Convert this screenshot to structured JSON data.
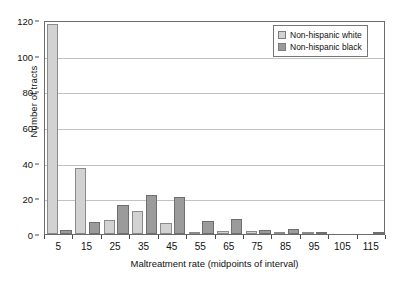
{
  "chart_data": {
    "type": "bar",
    "title": "",
    "subtitle": "",
    "xlabel": "Maltreatment rate (midpoints of interval)",
    "ylabel": "Number of tracts",
    "categories": [
      5,
      15,
      25,
      35,
      45,
      55,
      65,
      75,
      85,
      95,
      105,
      115
    ],
    "xtick_labels": [
      "5",
      "15",
      "25",
      "35",
      "45",
      "55",
      "65",
      "75",
      "85",
      "95",
      "105",
      "115"
    ],
    "ytick_labels": [
      "0",
      "20",
      "40",
      "60",
      "80",
      "100",
      "120"
    ],
    "ytick_values": [
      0,
      20,
      40,
      60,
      80,
      100,
      120
    ],
    "ylim": [
      0,
      120
    ],
    "xlim": [
      0,
      120
    ],
    "grid": "horizontal",
    "legend_position": "top-right",
    "series": [
      {
        "name": "Non-hispanic white",
        "color": "#d2d2d2",
        "values": [
          118,
          37,
          8,
          13,
          6,
          1,
          1.5,
          1.5,
          0.5,
          0.5,
          0,
          0
        ]
      },
      {
        "name": "Non-hispanic black",
        "color": "#9b9b9b",
        "values": [
          2,
          7,
          16,
          22,
          21,
          7.5,
          8.5,
          2.5,
          3,
          0.5,
          0,
          0.7
        ]
      }
    ]
  },
  "legend": {
    "items": [
      {
        "label": "Non-hispanic white",
        "swatch": "white"
      },
      {
        "label": "Non-hispanic black",
        "swatch": "black"
      }
    ]
  },
  "colors": {
    "white_bar": "#d2d2d2",
    "black_bar": "#9b9b9b",
    "gridline": "#c3c3c3",
    "axis": "#6b6b6b",
    "background": "#ffffff"
  }
}
